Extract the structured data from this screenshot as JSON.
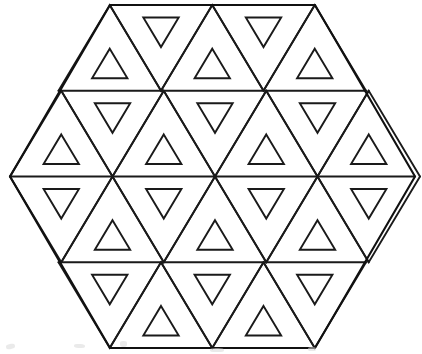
{
  "figure": {
    "kind": "geometric-line-drawing",
    "canvas": {
      "width": 422,
      "height": 354
    },
    "colors": {
      "background": "#ffffff",
      "stroke": "#1a1a1a",
      "outline_stroke": "#111111",
      "smudge": "#d8d8d8"
    },
    "stroke_width": 1.9,
    "outline_stroke_width": 2.1
  },
  "hexagon": {
    "name": "outer-hexagon",
    "center": {
      "x": 212.5,
      "y": 176.5
    },
    "vertices": [
      {
        "x": 110,
        "y": 5
      },
      {
        "x": 315,
        "y": 5
      },
      {
        "x": 415,
        "y": 176.5
      },
      {
        "x": 315,
        "y": 348
      },
      {
        "x": 110,
        "y": 348
      },
      {
        "x": 10,
        "y": 176.5
      }
    ],
    "edge_count": 6
  },
  "grid": {
    "row_boundaries_y": [
      5,
      90.75,
      176.5,
      262.25,
      348
    ],
    "row_height": 85.75,
    "cell_width": 102.5,
    "rows": [
      {
        "index": 0,
        "y_top": 5,
        "y_bottom": 90.75,
        "x_start": 58.5,
        "cell_count": 5,
        "first_orientation": "up",
        "orientations": [
          "up",
          "down",
          "up",
          "down",
          "up"
        ]
      },
      {
        "index": 1,
        "y_top": 90.75,
        "y_bottom": 176.5,
        "x_start": 10,
        "cell_count": 7,
        "first_orientation": "up",
        "orientations": [
          "up",
          "down",
          "up",
          "down",
          "up",
          "down",
          "up"
        ]
      },
      {
        "index": 2,
        "y_top": 176.5,
        "y_bottom": 262.25,
        "x_start": 10,
        "cell_count": 7,
        "first_orientation": "down",
        "orientations": [
          "down",
          "up",
          "down",
          "up",
          "down",
          "up",
          "down"
        ]
      },
      {
        "index": 3,
        "y_top": 262.25,
        "y_bottom": 348,
        "x_start": 58.5,
        "cell_count": 5,
        "first_orientation": "down",
        "orientations": [
          "down",
          "up",
          "down",
          "up",
          "down"
        ]
      }
    ],
    "total_cells": 24,
    "horizontal_rules": [
      {
        "y": 90.75,
        "x1": 58.5,
        "x2": 366.5
      },
      {
        "y": 176.5,
        "x1": 10,
        "x2": 415
      },
      {
        "y": 262.25,
        "x1": 58.5,
        "x2": 366.5
      }
    ]
  },
  "inner_triangle": {
    "name": "inner-triangle",
    "scale": 0.345,
    "inset_from_base": 12.5,
    "count": 24,
    "description": "Each triangular cell encloses one smaller outlined triangle of the same orientation."
  },
  "artifacts": {
    "name": "scan-smudges",
    "marks": [
      {
        "x": 6,
        "y": 344,
        "w": 9,
        "h": 5,
        "rot": -12
      },
      {
        "x": 74,
        "y": 344,
        "w": 11,
        "h": 4,
        "rot": 4
      },
      {
        "x": 120,
        "y": 341,
        "w": 7,
        "h": 6,
        "rot": 0
      },
      {
        "x": 210,
        "y": 348,
        "w": 14,
        "h": 4,
        "rot": 0
      },
      {
        "x": 308,
        "y": 347,
        "w": 8,
        "h": 4,
        "rot": 0
      }
    ]
  }
}
